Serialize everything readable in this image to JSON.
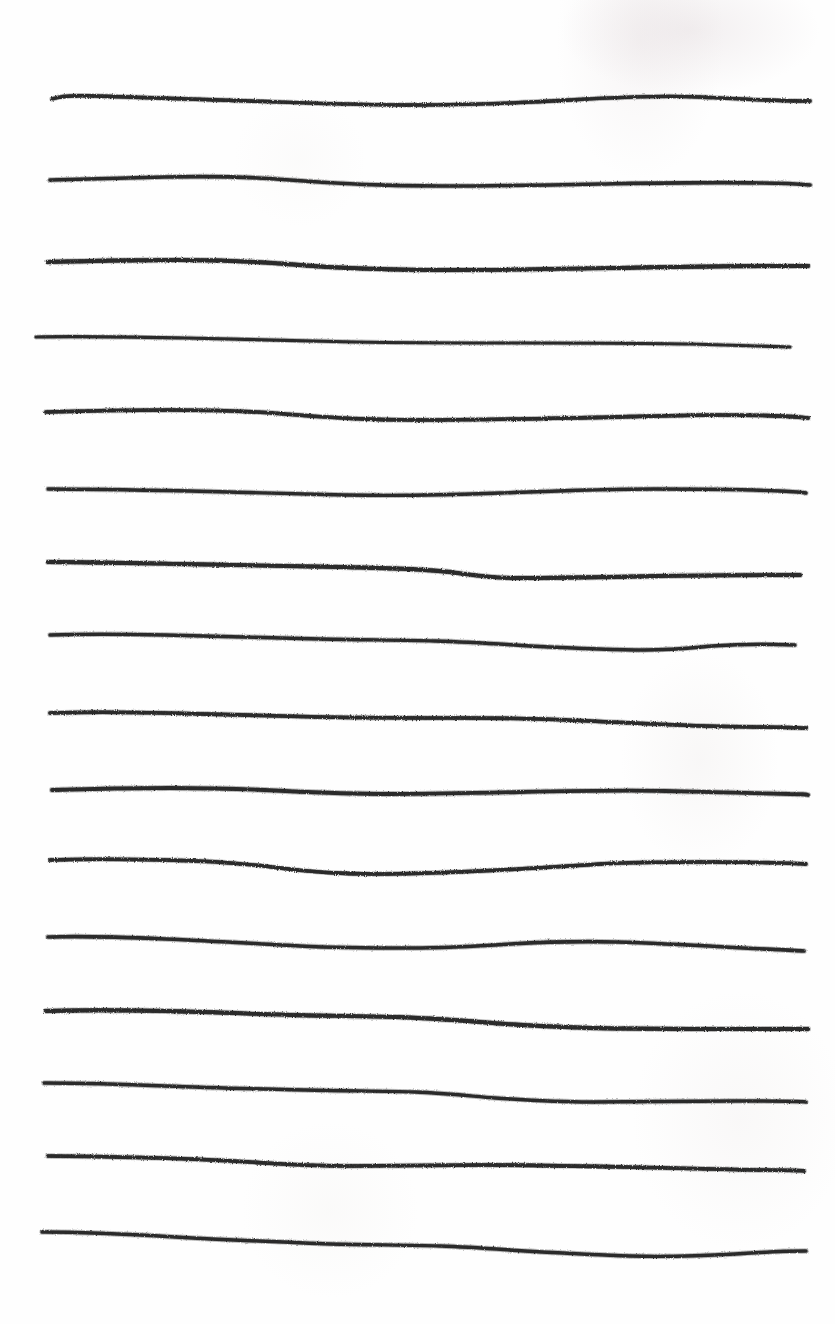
{
  "document": {
    "title": "Hand-drawn ruled lines",
    "description": "A scanned sheet of white paper bearing sixteen freehand horizontal ink strokes drawn across the page.",
    "medium": "ink on paper",
    "orientation": "portrait"
  },
  "canvas": {
    "width": 835,
    "height": 1324,
    "background_color": "#fefefe",
    "ink_color": "#2b2b2b"
  },
  "paper": {
    "has_texture": true,
    "smudge_regions": [
      "top-right",
      "mid-right",
      "lower-right"
    ],
    "smudge_color": "#ded4d6"
  },
  "strokes": {
    "count": 16,
    "left_margin": 50,
    "right_margin": 810,
    "average_spacing": 76,
    "items": [
      {
        "index": 1,
        "label": "rule-line-1",
        "y": 98,
        "x_start": 52,
        "x_end": 810,
        "thickness": 3.4,
        "path": "M52,99 C60,96 72,95 96,96 C140,97 190,99 250,101 C310,103 360,105 412,105 C470,105 520,103 570,100 C620,97 660,95 700,97 C740,99 775,101 810,101"
      },
      {
        "index": 2,
        "label": "rule-line-2",
        "y": 180,
        "x_start": 50,
        "x_end": 810,
        "thickness": 3.6,
        "path": "M50,180 C80,179 120,178 165,177 C215,176 255,177 290,180 C340,184 390,186 440,186 C500,186 550,185 600,184 C660,183 710,182 760,183 C785,183 800,184 810,185"
      },
      {
        "index": 3,
        "label": "rule-line-3",
        "y": 262,
        "x_start": 48,
        "x_end": 808,
        "thickness": 3.8,
        "path": "M48,262 C85,261 130,260 180,260 C230,260 265,262 300,265 C350,269 400,270 450,270 C510,270 560,269 615,268 C670,267 720,266 765,266 C788,266 800,266 808,266"
      },
      {
        "index": 4,
        "label": "rule-line-4",
        "y": 338,
        "x_start": 36,
        "x_end": 790,
        "thickness": 3.2,
        "path": "M36,337 C80,336 130,337 185,338 C245,339 300,341 355,342 C415,343 470,343 525,343 C585,343 640,343 690,344 C730,345 765,346 790,347"
      },
      {
        "index": 5,
        "label": "rule-line-5",
        "y": 412,
        "x_start": 46,
        "x_end": 808,
        "thickness": 3.6,
        "path": "M46,412 C80,411 125,410 170,410 C215,410 250,411 285,414 C330,418 370,420 415,420 C470,420 520,419 570,418 C625,417 675,415 720,415 C760,415 790,416 808,418"
      },
      {
        "index": 6,
        "label": "rule-line-6",
        "y": 490,
        "x_start": 48,
        "x_end": 806,
        "thickness": 3.4,
        "path": "M48,489 C90,489 140,490 190,491 C245,492 295,494 345,495 C400,496 450,495 500,493 C555,491 605,489 655,489 C705,489 755,490 780,491 C795,492 802,492 806,493"
      },
      {
        "index": 7,
        "label": "rule-line-7",
        "y": 565,
        "x_start": 48,
        "x_end": 800,
        "thickness": 3.8,
        "path": "M48,562 C85,562 130,563 180,564 C235,565 290,566 340,567 C390,568 425,569 450,572 C472,575 490,578 515,578 C560,578 610,577 660,576 C710,575 760,575 800,575"
      },
      {
        "index": 8,
        "label": "rule-line-8",
        "y": 638,
        "x_start": 50,
        "x_end": 795,
        "thickness": 3.4,
        "path": "M50,635 C80,634 120,634 165,635 C215,636 270,638 320,639 C370,640 405,640 435,641 C470,642 500,644 530,646 C570,648 610,650 645,650 C672,650 690,648 712,646 C740,644 770,644 795,645"
      },
      {
        "index": 9,
        "label": "rule-line-9",
        "y": 715,
        "x_start": 50,
        "x_end": 806,
        "thickness": 3.6,
        "path": "M50,713 C80,712 120,712 165,713 C220,714 270,716 320,717 C375,718 420,718 465,718 C510,718 550,719 590,721 C630,723 670,725 705,726 C745,727 780,727 806,728"
      },
      {
        "index": 10,
        "label": "rule-line-10",
        "y": 790,
        "x_start": 52,
        "x_end": 808,
        "thickness": 3.8,
        "path": "M52,790 C85,789 125,788 170,788 C215,788 250,789 285,791 C325,793 355,794 390,794 C440,794 480,793 520,792 C570,791 620,790 665,791 C710,792 760,793 790,794 C800,794 805,794 808,795"
      },
      {
        "index": 11,
        "label": "rule-line-11",
        "y": 862,
        "x_start": 50,
        "x_end": 806,
        "thickness": 3.4,
        "path": "M50,860 C80,859 120,859 165,860 C215,861 250,864 280,868 C310,872 340,874 375,874 C420,874 460,872 500,870 C540,868 570,866 600,864 C635,862 670,862 705,862 C750,862 785,863 806,864"
      },
      {
        "index": 12,
        "label": "rule-line-12",
        "y": 938,
        "x_start": 48,
        "x_end": 804,
        "thickness": 3.6,
        "path": "M48,937 C80,936 120,937 165,939 C215,941 260,944 300,946 C340,948 375,948 410,948 C450,948 480,946 510,944 C545,942 580,941 615,942 C650,943 690,945 725,947 C760,949 790,950 804,951"
      },
      {
        "index": 13,
        "label": "rule-line-13",
        "y": 1012,
        "x_start": 46,
        "x_end": 808,
        "thickness": 3.8,
        "path": "M46,1011 C80,1010 120,1010 165,1011 C215,1012 255,1014 290,1015 C330,1016 360,1016 395,1017 C430,1018 455,1020 480,1022 C515,1025 550,1027 590,1028 C640,1029 690,1029 735,1029 C775,1029 798,1029 808,1029"
      },
      {
        "index": 14,
        "label": "rule-line-14",
        "y": 1085,
        "x_start": 44,
        "x_end": 806,
        "thickness": 3.4,
        "path": "M44,1083 C80,1083 120,1084 165,1086 C215,1088 260,1089 305,1090 C350,1091 385,1091 415,1092 C445,1093 470,1096 495,1098 C525,1100 555,1102 590,1102 C640,1102 690,1101 735,1101 C775,1101 798,1101 806,1102"
      },
      {
        "index": 15,
        "label": "rule-line-15",
        "y": 1158,
        "x_start": 48,
        "x_end": 804,
        "thickness": 3.6,
        "path": "M48,1156 C80,1156 120,1157 160,1158 C200,1159 235,1161 265,1163 C295,1165 320,1166 350,1166 C395,1166 440,1165 485,1165 C535,1165 580,1166 625,1167 C670,1168 715,1169 755,1170 C785,1170 798,1170 804,1171"
      },
      {
        "index": 16,
        "label": "rule-line-16",
        "y": 1238,
        "x_start": 42,
        "x_end": 806,
        "thickness": 3.4,
        "path": "M42,1232 C80,1232 125,1234 175,1237 C230,1240 280,1242 330,1244 C375,1245 410,1245 440,1246 C470,1247 495,1249 525,1251 C560,1253 595,1255 630,1256 C665,1257 700,1256 735,1254 C765,1252 790,1251 806,1251"
      }
    ]
  }
}
